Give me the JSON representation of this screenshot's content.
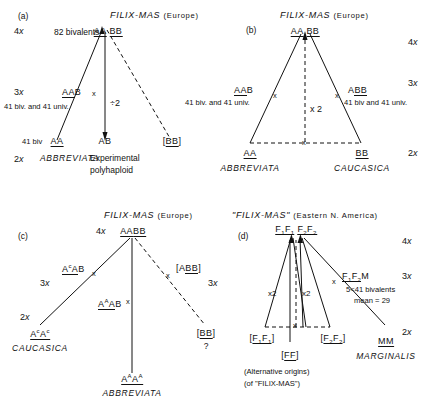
{
  "figure": {
    "type": "diagram",
    "panels": [
      {
        "id": "a",
        "tag": "(a)",
        "title": "FILIX-MAS",
        "title_region": "(Europe)",
        "ploidy_levels": [
          "4x",
          "3x",
          "2x"
        ],
        "nodes": [
          {
            "name": "apex",
            "genome": "AA BB",
            "note": "82 bivalents"
          },
          {
            "name": "left-hybrid",
            "genome": "AAB",
            "note": "41 biv. and 41 univ."
          },
          {
            "name": "left-parent",
            "genome": "AA",
            "note": "41 biv",
            "species": "ABBREVIATA"
          },
          {
            "name": "polyhaploid",
            "genome": "AB",
            "note": "Experimental polyhaploid"
          },
          {
            "name": "right-parent",
            "genome": "[BB]",
            "note": ""
          }
        ],
        "edge_labels": [
          "÷2"
        ]
      },
      {
        "id": "b",
        "tag": "(b)",
        "title": "FILIX-MAS",
        "title_region": "(Europe)",
        "ploidy_levels": [
          "4x",
          "3x",
          "2x"
        ],
        "nodes": [
          {
            "name": "apex",
            "genome": "AA BB",
            "note": ""
          },
          {
            "name": "left-hybrid",
            "genome": "AAB",
            "note": "41 biv. and 41 univ."
          },
          {
            "name": "right-hybrid",
            "genome": "ABB",
            "note": "41 biv and 41 univ."
          },
          {
            "name": "left-parent",
            "genome": "AA",
            "species": "ABBREVIATA"
          },
          {
            "name": "right-parent",
            "genome": "BB",
            "species": "CAUCASICA"
          }
        ],
        "edge_labels": [
          "x 2"
        ]
      },
      {
        "id": "c",
        "tag": "(c)",
        "title": "FILIX-MAS",
        "title_region": "(Europe)",
        "ploidy_levels": [
          "4x",
          "3x",
          "3x",
          "2x",
          "2x"
        ],
        "nodes": [
          {
            "name": "apex",
            "genome": "AABB",
            "note": ""
          },
          {
            "name": "left-hybrid",
            "genome": "AcAB",
            "note": ""
          },
          {
            "name": "mid-hybrid",
            "genome": "AAAB",
            "note": ""
          },
          {
            "name": "right-hybrid",
            "genome": "[ABB]",
            "note": ""
          },
          {
            "name": "left-parent",
            "genome": "AcAc",
            "species": "CAUCASICA"
          },
          {
            "name": "mid-parent",
            "genome": "AAAA",
            "species": "ABBREVIATA"
          },
          {
            "name": "right-parent",
            "genome": "[BB]",
            "note": "?"
          }
        ],
        "edge_labels": []
      },
      {
        "id": "d",
        "tag": "(d)",
        "title": "\"FILIX-MAS\"",
        "title_region": "(Eastern N. America)",
        "ploidy_levels": [
          "4x",
          "3x",
          "2x"
        ],
        "nodes": [
          {
            "name": "apex",
            "genome": "F1F1 F2F2",
            "note": ""
          },
          {
            "name": "right-hybrid",
            "genome": "F1F2M",
            "note": "5<41 bivalents mean = 29"
          },
          {
            "name": "left-parent",
            "genome": "[F1F1]",
            "note": ""
          },
          {
            "name": "mid-parent",
            "genome": "[FF]",
            "note": ""
          },
          {
            "name": "right-alt-parent",
            "genome": "[F2F2]",
            "note": ""
          },
          {
            "name": "right-parent",
            "genome": "MM",
            "species": "MARGINALIS"
          }
        ],
        "edge_labels": [
          "x2",
          "x2"
        ],
        "footnotes": [
          "(Alternative origins)",
          "(of \"FILIX-MAS\")"
        ]
      }
    ]
  },
  "a": {
    "tag": "(a)",
    "title": "FILIX-MAS",
    "region": "(Europe)",
    "ploidy_4x": "4",
    "ploidy_3x": "3",
    "ploidy_2x": "2",
    "x_letter": "x",
    "bivalents": "82 bivalents",
    "apex_aa": "AA",
    "apex_bb": "BB",
    "mid_left_genome_u": "AA",
    "mid_left_genome_tail": "B",
    "mid_left_note": "41 biv. and 41 univ.",
    "cross_mark": "x",
    "div2": "÷2",
    "left_note": "41 biv",
    "left_genome": "AA",
    "left_species": "ABBREVIATA",
    "mid_genome": "AB",
    "mid_caption_1": "Experimental",
    "mid_caption_2": "polyhaploid",
    "right_bracket_open": "[",
    "right_genome": "BB",
    "right_bracket_close": "]"
  },
  "b": {
    "tag": "(b)",
    "title": "FILIX-MAS",
    "region": "(Europe)",
    "ploidy_4x": "4",
    "ploidy_3x": "3",
    "ploidy_2x": "2",
    "x_letter": "x",
    "apex_aa": "AA",
    "apex_bb": "BB",
    "left_hybrid_u": "AA",
    "left_hybrid_tail": "B",
    "left_hybrid_note": "41 biv. and 41 univ.",
    "right_hybrid_head": "A",
    "right_hybrid_u": "BB",
    "right_hybrid_note": "41 biv and 41 univ.",
    "cross_mark": "x",
    "times2": "x 2",
    "left_genome": "AA",
    "left_species": "ABBREVIATA",
    "right_genome": "BB",
    "right_species": "CAUCASICA"
  },
  "c": {
    "tag": "(c)",
    "title": "FILIX-MAS",
    "region": "(Europe)",
    "ploidy_4x": "4",
    "ploidy_3x_left": "3",
    "ploidy_3x_right": "3",
    "ploidy_2x": "2",
    "x_letter": "x",
    "apex_aa": "AA",
    "apex_bb": "BB",
    "left_hybrid_sup": "c",
    "left_hybrid_tail": "AB",
    "mid_hybrid_sup": "A",
    "mid_hybrid_tail": "B",
    "right_hybrid_open": "[",
    "right_hybrid_head": "A",
    "right_hybrid_u": "BB",
    "right_hybrid_close": "]",
    "cross_mark": "x",
    "left_genome_sup": "c",
    "left_species": "CAUCASICA",
    "mid_genome_sup": "A",
    "mid_species": "ABBREVIATA",
    "right_open": "[",
    "right_genome": "BB",
    "right_close": "]",
    "right_query": "?"
  },
  "d": {
    "tag": "(d)",
    "title": "\"FILIX-MAS\"",
    "region": "(Eastern N. America)",
    "ploidy_4x": "4",
    "ploidy_3x": "3",
    "ploidy_2x": "2",
    "x_letter": "x",
    "apex_f1": "F",
    "apex_f1_sub": "1",
    "apex_f2": "F",
    "apex_f2_sub": "2",
    "right_hybrid_tail": "M",
    "right_note_1": "5<41 bivalents",
    "right_note_2": "mean = 29",
    "cross_mark": "x",
    "times2_left": "x2",
    "times2_right": "x2",
    "alt_left_open": "[",
    "alt_left_close": "]",
    "alt_right_open": "[",
    "alt_right_close": "]",
    "ff_open": "[",
    "ff_genome": "FF",
    "ff_close": "]",
    "footnote_1": "(Alternative origins)",
    "footnote_2": "(of \"FILIX-MAS\")",
    "right_genome": "MM",
    "right_species": "MARGINALIS"
  },
  "colors": {
    "ink": "#111111",
    "background": "#ffffff"
  }
}
